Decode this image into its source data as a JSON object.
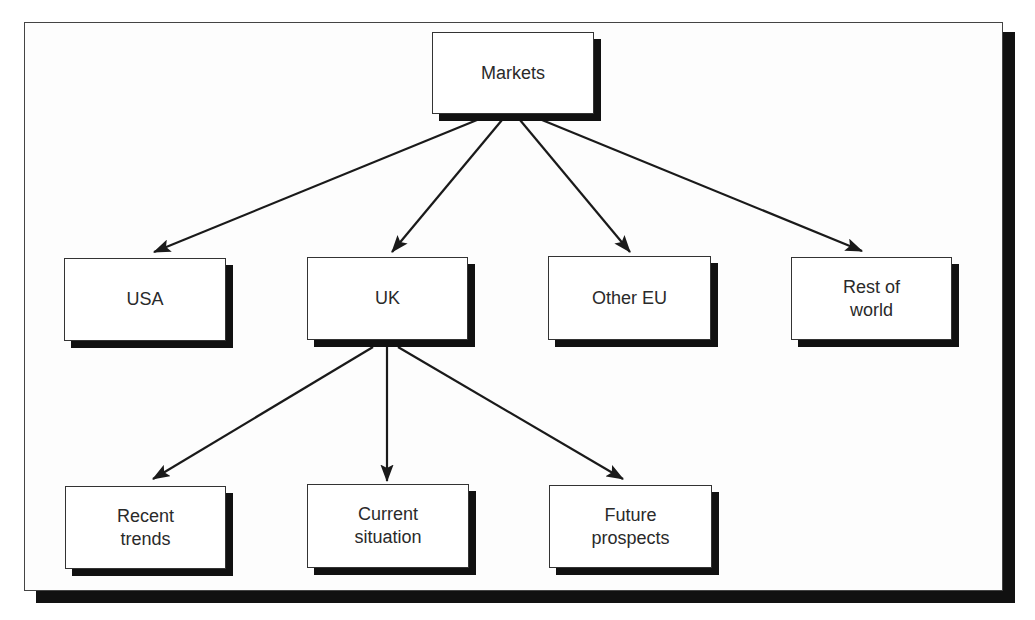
{
  "diagram": {
    "type": "tree",
    "root": {
      "id": "markets",
      "label": "Markets",
      "box": {
        "x": 432,
        "y": 32,
        "w": 162,
        "h": 82
      }
    },
    "level1": [
      {
        "id": "usa",
        "label": "USA",
        "box": {
          "x": 64,
          "y": 258,
          "w": 162,
          "h": 83
        }
      },
      {
        "id": "uk",
        "label": "UK",
        "box": {
          "x": 307,
          "y": 257,
          "w": 161,
          "h": 83
        }
      },
      {
        "id": "other-eu",
        "label": "Other EU",
        "box": {
          "x": 548,
          "y": 256,
          "w": 163,
          "h": 84
        }
      },
      {
        "id": "rest-of-world",
        "label": "Rest of\nworld",
        "box": {
          "x": 791,
          "y": 257,
          "w": 161,
          "h": 83
        }
      }
    ],
    "level2": [
      {
        "id": "recent-trends",
        "parent": "uk",
        "label": "Recent\ntrends",
        "box": {
          "x": 65,
          "y": 486,
          "w": 161,
          "h": 83
        }
      },
      {
        "id": "current-situation",
        "parent": "uk",
        "label": "Current\nsituation",
        "box": {
          "x": 307,
          "y": 484,
          "w": 162,
          "h": 84
        }
      },
      {
        "id": "future-prospects",
        "parent": "uk",
        "label": "Future\nprospects",
        "box": {
          "x": 549,
          "y": 485,
          "w": 163,
          "h": 83
        }
      }
    ],
    "edges": [
      {
        "from": "markets",
        "to": "usa",
        "x1": 477,
        "y1": 120,
        "x2": 154,
        "y2": 252
      },
      {
        "from": "markets",
        "to": "uk",
        "x1": 502,
        "y1": 120,
        "x2": 392,
        "y2": 252
      },
      {
        "from": "markets",
        "to": "other-eu",
        "x1": 520,
        "y1": 120,
        "x2": 630,
        "y2": 252
      },
      {
        "from": "markets",
        "to": "rest-of-world",
        "x1": 542,
        "y1": 120,
        "x2": 862,
        "y2": 251
      },
      {
        "from": "uk",
        "to": "recent-trends",
        "x1": 373,
        "y1": 347,
        "x2": 153,
        "y2": 479
      },
      {
        "from": "uk",
        "to": "current-situation",
        "x1": 387,
        "y1": 347,
        "x2": 387,
        "y2": 481
      },
      {
        "from": "uk",
        "to": "future-prospects",
        "x1": 398,
        "y1": 347,
        "x2": 623,
        "y2": 479
      }
    ],
    "shadow_offset": 7
  },
  "colors": {
    "line": "#1a1a1a",
    "shadow": "#111111",
    "text": "#2a2a2a",
    "box_fill": "#ffffff",
    "frame_border": "#444444"
  }
}
